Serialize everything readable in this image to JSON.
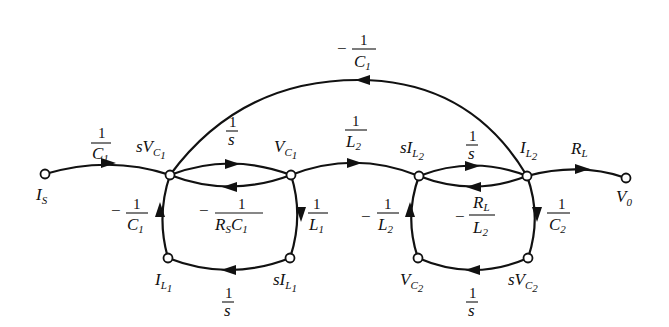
{
  "diagram": {
    "type": "signal-flow-graph",
    "nodes": {
      "Is": {
        "label": "I",
        "sub": "S",
        "x": 45,
        "y": 174
      },
      "sVC1": {
        "label": "sV",
        "sub": "C",
        "subsub": "1",
        "x": 170,
        "y": 175
      },
      "VC1": {
        "label": "V",
        "sub": "C",
        "subsub": "1",
        "x": 291,
        "y": 175
      },
      "sIL2": {
        "label": "sI",
        "sub": "L",
        "subsub": "2",
        "x": 419,
        "y": 176
      },
      "IL2": {
        "label": "I",
        "sub": "L",
        "subsub": "2",
        "x": 527,
        "y": 176
      },
      "V0": {
        "label": "V",
        "sub": "0",
        "x": 626,
        "y": 178
      },
      "IL1": {
        "label": "I",
        "sub": "L",
        "subsub": "1",
        "x": 168,
        "y": 258
      },
      "sIL1": {
        "label": "sI",
        "sub": "L",
        "subsub": "1",
        "x": 290,
        "y": 258
      },
      "VC2": {
        "label": "V",
        "sub": "C",
        "subsub": "2",
        "x": 418,
        "y": 258
      },
      "sVC2": {
        "label": "sV",
        "sub": "C",
        "subsub": "2",
        "x": 528,
        "y": 258
      }
    },
    "edges": [
      {
        "from": "Is",
        "to": "sVC1",
        "gain": "1/C1",
        "sign": "",
        "num": "1",
        "den": "C",
        "den_sub": "1"
      },
      {
        "from": "sVC1",
        "to": "VC1",
        "gain": "1/s",
        "sign": "",
        "num": "1",
        "den": "s"
      },
      {
        "from": "VC1",
        "to": "sVC1",
        "gain": "-1/(Rs C1)",
        "sign": "−",
        "num": "1",
        "den": "R",
        "den_sub": "S",
        "den2": "C",
        "den2_sub": "1"
      },
      {
        "from": "VC1",
        "to": "sIL1",
        "gain": "1/L1",
        "sign": "",
        "num": "1",
        "den": "L",
        "den_sub": "1"
      },
      {
        "from": "sIL1",
        "to": "IL1",
        "gain": "1/s",
        "sign": "",
        "num": "1",
        "den": "s"
      },
      {
        "from": "IL1",
        "to": "sVC1",
        "gain": "-1/C1",
        "sign": "−",
        "num": "1",
        "den": "C",
        "den_sub": "1"
      },
      {
        "from": "VC1",
        "to": "sIL2",
        "gain": "1/L2",
        "sign": "",
        "num": "1",
        "den": "L",
        "den_sub": "2"
      },
      {
        "from": "sIL2",
        "to": "IL2",
        "gain": "1/s",
        "sign": "",
        "num": "1",
        "den": "s"
      },
      {
        "from": "IL2",
        "to": "sIL2",
        "gain": "-RL/L2",
        "sign": "−",
        "num": "R",
        "num_sub": "L",
        "den": "L",
        "den_sub": "2"
      },
      {
        "from": "IL2",
        "to": "sVC2",
        "gain": "1/C2",
        "sign": "",
        "num": "1",
        "den": "C",
        "den_sub": "2"
      },
      {
        "from": "sVC2",
        "to": "VC2",
        "gain": "1/s",
        "sign": "",
        "num": "1",
        "den": "s"
      },
      {
        "from": "VC2",
        "to": "sIL2",
        "gain": "-1/L2",
        "sign": "−",
        "num": "1",
        "den": "L",
        "den_sub": "2"
      },
      {
        "from": "IL2",
        "to": "sVC1",
        "gain": "-1/C1",
        "sign": "−",
        "num": "1",
        "den": "C",
        "den_sub": "1"
      },
      {
        "from": "IL2",
        "to": "V0",
        "gain": "RL",
        "sign": "",
        "num": "R",
        "num_sub": "L"
      }
    ],
    "colors": {
      "ink": "#111111",
      "background": "#ffffff"
    }
  }
}
